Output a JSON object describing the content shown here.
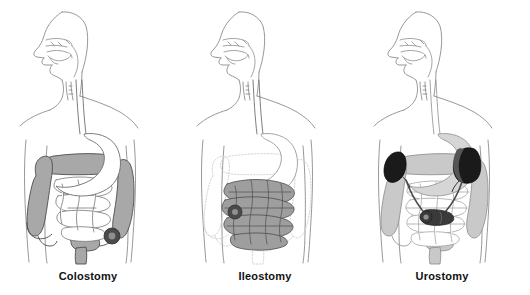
{
  "figure": {
    "background_color": "#ffffff",
    "panel_count": 3
  },
  "palette": {
    "body_outline": "#8c8c8c",
    "organ_outline": "#4d4d4d",
    "colon_fill": "#a8a8a8",
    "colon_fill_light": "#c9c9c9",
    "small_intestine_fill_white": "#ffffff",
    "small_intestine_fill_gray": "#9e9e9e",
    "ghost_outline": "#cfcfcf",
    "stoma_dark": "#4a4a4a",
    "stoma_center": "#8f8f8f",
    "kidney_dark": "#1a1a1a",
    "kidney_mid": "#555555",
    "conduit_dark": "#3a3a3a",
    "stomach_fill": "#ffffff",
    "label_color": "#111111"
  },
  "panels": [
    {
      "id": "colostomy",
      "label": "Colostomy",
      "x": 0,
      "highlight_organ": "large-intestine",
      "highlighted_fill": "#a8a8a8",
      "ghosted_organ": "none",
      "stoma": {
        "present": true,
        "type": "colostomy-stoma",
        "side": "left-lower-abdomen",
        "cx": 112,
        "cy": 236,
        "r": 8,
        "color": "#4a4a4a",
        "center_color": "#8f8f8f"
      },
      "extra_features": [
        "rectum",
        "sigmoid-colon"
      ]
    },
    {
      "id": "ileostomy",
      "label": "Ileostomy",
      "x": 177,
      "highlight_organ": "small-intestine",
      "highlighted_fill": "#9e9e9e",
      "ghosted_organ": "large-intestine",
      "stoma": {
        "present": true,
        "type": "ileostomy-stoma",
        "side": "right-lower-abdomen",
        "cx": 58,
        "cy": 212,
        "r": 7,
        "color": "#4a4a4a",
        "center_color": "#8f8f8f"
      },
      "extra_features": [
        "ghost-colon-outline",
        "appendix"
      ]
    },
    {
      "id": "urostomy",
      "label": "Urostomy",
      "x": 354,
      "highlight_organ": "kidneys-ureters-ileal-conduit",
      "highlighted_fill": "#1a1a1a",
      "ghosted_organ": "none",
      "stoma": {
        "present": true,
        "type": "urostomy-stoma",
        "side": "right-lower-abdomen",
        "cx": 76,
        "cy": 216,
        "r": 6,
        "color": "#3a3a3a",
        "center_color": "#8f8f8f"
      },
      "extra_features": [
        "left-kidney",
        "right-kidney",
        "ureters",
        "ileal-conduit",
        "colon-gray"
      ]
    }
  ],
  "anatomy_common": [
    "head-profile",
    "nasal-cavity",
    "oral-cavity",
    "tongue",
    "pharynx",
    "trachea",
    "esophagus",
    "stomach",
    "torso-outline"
  ]
}
